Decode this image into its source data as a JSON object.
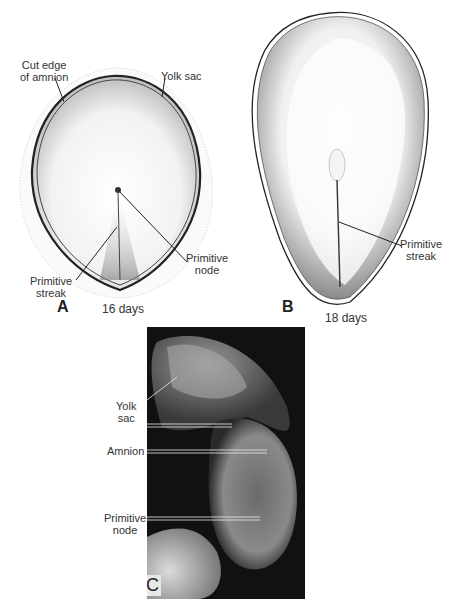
{
  "figure": {
    "panels": [
      {
        "id": "A",
        "letter": "A",
        "caption": "16 days",
        "labels": {
          "cut_edge_amnion": [
            "Cut edge",
            "of amnion"
          ],
          "yolk_sac": "Yolk sac",
          "primitive_node": [
            "Primitive",
            "node"
          ],
          "primitive_streak": [
            "Primitive",
            "streak"
          ]
        }
      },
      {
        "id": "B",
        "letter": "B",
        "caption": "18 days",
        "labels": {
          "primitive_streak": [
            "Primitive",
            "streak"
          ]
        }
      },
      {
        "id": "C",
        "letter": "C",
        "type": "photograph",
        "labels": {
          "yolk_sac": [
            "Yolk",
            "sac"
          ],
          "amnion": "Amnion",
          "primitive_node": [
            "Primitive",
            "node"
          ]
        }
      }
    ]
  }
}
